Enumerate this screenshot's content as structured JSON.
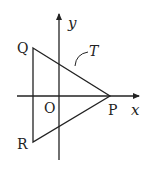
{
  "diagram": {
    "type": "coordinate-geometry",
    "colors": {
      "stroke": "#222222",
      "background": "#ffffff"
    },
    "axes": {
      "x_label": "x",
      "y_label": "y",
      "origin_label": "O"
    },
    "points": [
      {
        "id": "Q",
        "label": "Q"
      },
      {
        "id": "R",
        "label": "R"
      },
      {
        "id": "P",
        "label": "P"
      }
    ],
    "shape": {
      "name": "triangle",
      "vertices": [
        "Q",
        "P",
        "R"
      ],
      "label": "T"
    }
  }
}
